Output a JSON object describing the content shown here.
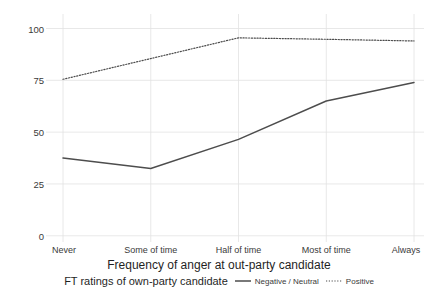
{
  "chart_data": {
    "type": "line",
    "title": "",
    "xlabel": "Frequency of anger at out-party candidate",
    "ylabel": "Percentage voting loyally",
    "categories": [
      "Never",
      "Some of time",
      "Half of time",
      "Most of time",
      "Always"
    ],
    "yticks": [
      0,
      25,
      50,
      75,
      100
    ],
    "ytick_labels": [
      "0",
      "25",
      "50",
      "75",
      "100"
    ],
    "ylim": [
      -3,
      107
    ],
    "grid": true,
    "legend_position": "bottom",
    "legend_title": "FT ratings of own-party candidate",
    "series": [
      {
        "name": "Negative / Neutral",
        "style": "solid",
        "color": "#4d4d4d",
        "values": [
          37.5,
          32.5,
          46.5,
          65.0,
          74.0
        ]
      },
      {
        "name": "Positive",
        "style": "dotted",
        "color": "#4d4d4d",
        "values": [
          75.5,
          85.5,
          95.5,
          94.8,
          94.0
        ]
      }
    ]
  },
  "axes": {
    "y_title": "Percentage voting loyally",
    "x_title": "Frequency of anger at out-party candidate"
  },
  "legend": {
    "title": "FT ratings of own-party candidate",
    "items": [
      {
        "label": "Negative / Neutral",
        "key": "solid-line-key"
      },
      {
        "label": "Positive",
        "key": "dotted-line-key"
      }
    ]
  }
}
